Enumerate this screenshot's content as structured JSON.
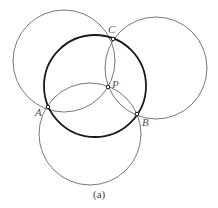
{
  "figure": {
    "caption": "(a)",
    "points": {
      "A": {
        "label": "A",
        "x": 48,
        "y": 107
      },
      "B": {
        "label": "B",
        "x": 137,
        "y": 114
      },
      "C": {
        "label": "C",
        "x": 113,
        "y": 39
      },
      "P": {
        "label": "P",
        "x": 108,
        "y": 87
      }
    },
    "circles": [
      {
        "name": "circumcircle-ABC",
        "style": "thick",
        "cx": 95,
        "cy": 86,
        "r": 51
      },
      {
        "name": "circle-APC",
        "style": "thin",
        "cx": 64,
        "cy": 61,
        "r": 51
      },
      {
        "name": "circle-CPB",
        "style": "thin",
        "cx": 156,
        "cy": 68,
        "r": 51
      },
      {
        "name": "circle-APB",
        "style": "thin",
        "cx": 90,
        "cy": 134,
        "r": 51
      }
    ],
    "colors": {
      "thick": "#1a1a1a",
      "thin": "#6a6a6a",
      "label": "#555555"
    }
  }
}
